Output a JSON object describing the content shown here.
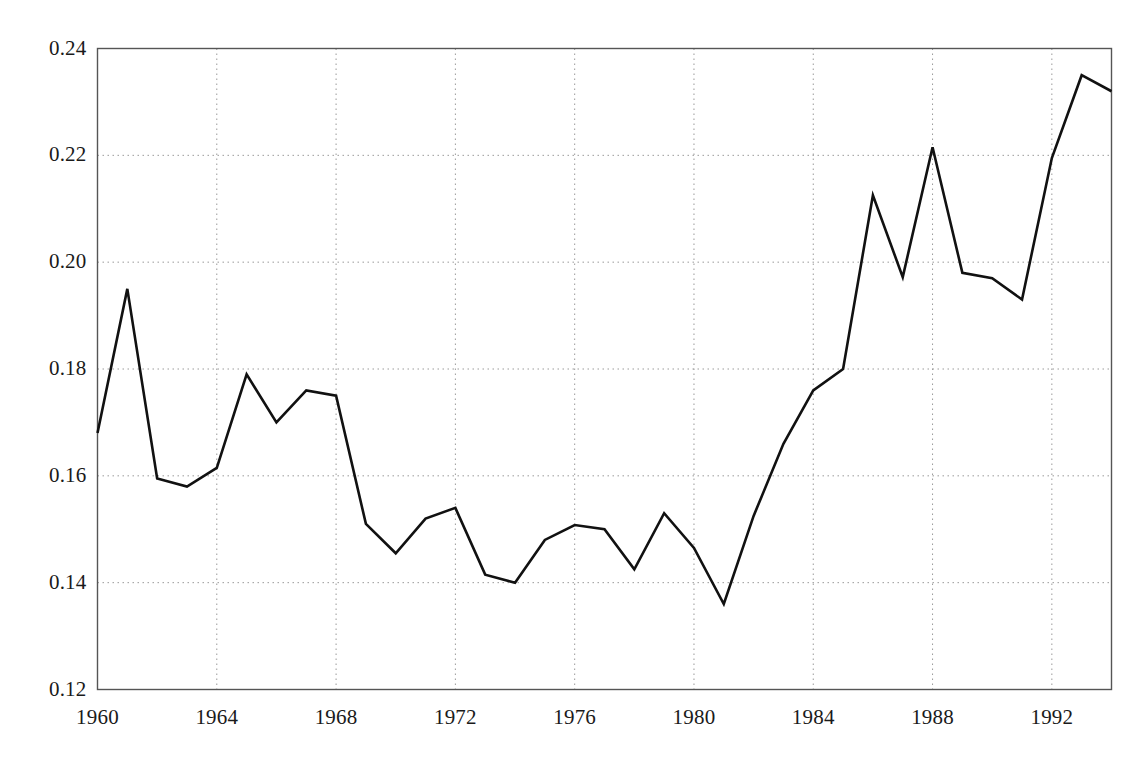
{
  "chart_data": {
    "type": "line",
    "title": "",
    "subtitle": "",
    "xlabel": "",
    "ylabel": "",
    "xlim": [
      1960,
      1994
    ],
    "ylim": [
      0.12,
      0.24
    ],
    "grid": true,
    "legend": null,
    "x_ticks": [
      "1960",
      "1964",
      "1968",
      "1972",
      "1976",
      "1980",
      "1984",
      "1988",
      "1992"
    ],
    "x_tick_values": [
      1960,
      1964,
      1968,
      1972,
      1976,
      1980,
      1984,
      1988,
      1992
    ],
    "y_ticks": [
      "0.12",
      "0.14",
      "0.16",
      "0.18",
      "0.20",
      "0.22",
      "0.24"
    ],
    "y_tick_values": [
      0.12,
      0.14,
      0.16,
      0.18,
      0.2,
      0.22,
      0.24
    ],
    "x": [
      1960,
      1961,
      1962,
      1963,
      1964,
      1965,
      1966,
      1967,
      1968,
      1969,
      1970,
      1971,
      1972,
      1973,
      1974,
      1975,
      1976,
      1977,
      1978,
      1979,
      1980,
      1981,
      1982,
      1983,
      1984,
      1985,
      1986,
      1987,
      1988,
      1989,
      1990,
      1991,
      1992,
      1993,
      1994
    ],
    "series": [
      {
        "name": "series-1",
        "color": "#111111",
        "line_width": 2.6,
        "values": [
          0.168,
          0.195,
          0.1595,
          0.158,
          0.1615,
          0.179,
          0.17,
          0.176,
          0.175,
          0.151,
          0.1455,
          0.152,
          0.154,
          0.1415,
          0.14,
          0.148,
          0.1508,
          0.15,
          0.1425,
          0.153,
          0.1465,
          0.136,
          0.1525,
          0.166,
          0.176,
          0.18,
          0.2125,
          0.1972,
          0.2215,
          0.198,
          0.197,
          0.193,
          0.2195,
          0.235,
          0.232
        ]
      }
    ]
  },
  "axes": {
    "frame_color": "#555555",
    "grid_color": "#9a9a9a",
    "tick_text_color": "#1a1a1a"
  }
}
